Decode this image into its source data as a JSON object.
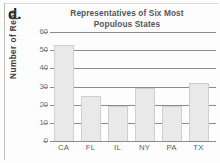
{
  "figure": {
    "part_label": "d."
  },
  "chart_data": {
    "type": "bar",
    "title": "Representatives of Six Most Populous States",
    "title_line1": "Representatives of Six Most",
    "title_line2": "Populous States",
    "xlabel": "",
    "ylabel": "Number of Reps",
    "categories": [
      "CA",
      "FL",
      "IL",
      "NY",
      "PA",
      "TX"
    ],
    "values": [
      53,
      25,
      19,
      29,
      19,
      32
    ],
    "ylim": [
      0,
      60
    ],
    "yticks": [
      0,
      10,
      20,
      30,
      40,
      50,
      60
    ],
    "ytick_labels": [
      "0",
      "10",
      "20",
      "30",
      "40",
      "50",
      "60"
    ],
    "grid": true,
    "grid_axis": "y",
    "legend": false,
    "bar_fill": "#e9e9e9",
    "bar_edge": "#cfcfcf",
    "grid_color": "#8c8c8c",
    "title_color": "#555555",
    "axis_label_color": "#6b6b6b"
  }
}
